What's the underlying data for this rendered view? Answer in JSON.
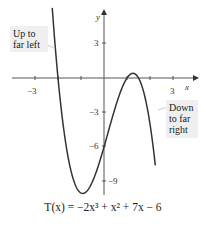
{
  "chart_data": {
    "type": "line",
    "title": "",
    "caption": "T(x) = −2x³ + x² + 7x − 6",
    "function": "-2*x^3 + x^2 + 7*x - 6",
    "xlabel": "x",
    "ylabel": "y",
    "xlim": [
      -4.3,
      3.6
    ],
    "ylim": [
      -11.3,
      6.8
    ],
    "x_ticks": [
      -3,
      -2,
      -1,
      1,
      2,
      3
    ],
    "x_tick_labels": [
      "-3",
      "3"
    ],
    "y_ticks": [
      3,
      -3,
      -6,
      -9
    ],
    "y_tick_labels": [
      "3",
      "-3",
      "-6",
      "-9"
    ],
    "grid": false,
    "series": [
      {
        "name": "T(x)",
        "x": [
          -2.0,
          -1.5,
          -1.0,
          -0.5,
          0.0,
          0.5,
          1.0,
          1.5,
          2.0
        ],
        "y": [
          0,
          -6.0,
          -10,
          -9.5,
          -6,
          -2.75,
          0,
          0,
          -4
        ]
      }
    ],
    "annotations": [
      {
        "text": "Up to far left"
      },
      {
        "text": "Down to far right"
      }
    ]
  },
  "labels": {
    "x_axis": "x",
    "y_axis": "y",
    "tick_neg3_x": "−3",
    "tick_3_x": "3",
    "tick_3_y": "3",
    "tick_neg3_y": "−3",
    "tick_neg6_y": "−6",
    "tick_neg9_y": "−9"
  },
  "callouts": {
    "left_line1": "Up to",
    "left_line2": "far left",
    "right_line1": "Down",
    "right_line2": "to far",
    "right_line3": "right"
  },
  "caption": "T(x) = −2x³ + x² + 7x − 6"
}
